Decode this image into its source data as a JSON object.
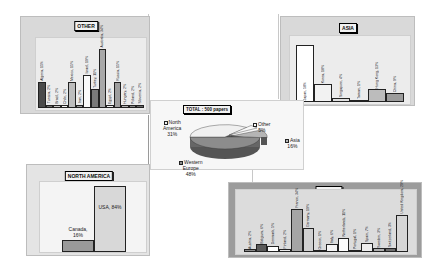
{
  "chart_data": [
    {
      "type": "pie",
      "title": "TOTAL : 500 papers",
      "categories": [
        "Western Europe",
        "North America",
        "Asia",
        "Other"
      ],
      "values": [
        48,
        31,
        16,
        5
      ],
      "labels": [
        "Western Europe 48%",
        "North America 31%",
        "Asia 16%",
        "Other 5%"
      ],
      "legend_position": "inline labels"
    },
    {
      "type": "bar",
      "title": "OTHER",
      "categories": [
        "Algeria",
        "Tunisia",
        "Brazil",
        "Chile",
        "Mexico",
        "Iran",
        "Israel",
        "Turkey",
        "Australia",
        "Egypt",
        "Russia",
        "Hungary",
        "Poland",
        "Slovenia"
      ],
      "values": [
        15,
        2,
        2,
        2,
        15,
        2,
        19,
        11,
        34,
        2,
        15,
        2,
        2,
        2
      ],
      "labels": [
        "Algeria, 15%",
        "Tunisia, 2%",
        "Brazil, 2%",
        "Chile, 2%",
        "Mexico, 15%",
        "Iran, 2%",
        "Israel, 19%",
        "Turkey, 11%",
        "Australia, 34%",
        "Egypt, 2%",
        "Russia, 15%",
        "Hungary, 2%",
        "Poland, 2%",
        "Slovenia, 2%"
      ],
      "xlabel": "",
      "ylabel": "",
      "grid": false
    },
    {
      "type": "bar",
      "title": "ASIA",
      "categories": [
        "Japan",
        "Korea",
        "Singapore",
        "Taiwan",
        "Hong Kong",
        "China"
      ],
      "values": [
        58,
        18,
        4,
        1,
        13,
        9
      ],
      "labels": [
        "Japan, 58%",
        "Korea, 18%",
        "Singapore, 4%",
        "Taiwan, 1%",
        "Hong Kong, 13%",
        "China, 9%"
      ],
      "xlabel": "",
      "ylabel": "",
      "grid": false
    },
    {
      "type": "bar",
      "title": "NORTH AMERICA",
      "categories": [
        "Canada",
        "USA"
      ],
      "values": [
        16,
        84
      ],
      "labels": [
        "Canada, 16%",
        "USA, 84%"
      ],
      "xlabel": "",
      "ylabel": "",
      "grid": false
    },
    {
      "type": "bar",
      "title": "EUROPE",
      "categories": [
        "Austria",
        "Belgium",
        "Denmark",
        "Finland",
        "France",
        "Germany",
        "Greece",
        "Italy",
        "Netherlands",
        "Portugal",
        "Spain",
        "Sweden",
        "Switzerland",
        "United Kingdom"
      ],
      "values": [
        2,
        6,
        5,
        2,
        34,
        19,
        1,
        6,
        11,
        1,
        7,
        3,
        3,
        29
      ],
      "labels": [
        "Austria, 2%",
        "Belgium, 6%",
        "Denmark, 5%",
        "Finland, 2%",
        "France, 34%",
        "Germany, 19%",
        "Greece, 1%",
        "Italy, 6%",
        "Netherlands, 11%",
        "Portugal, 1%",
        "Spain, 7%",
        "Sweden, 3%",
        "Switzerland, 3%",
        "United Kingdom, 29%"
      ],
      "xlabel": "",
      "ylabel": "",
      "grid": false
    }
  ],
  "pie": {
    "title": "TOTAL : 500 papers",
    "north_america_line1": "North",
    "north_america_line2": "America",
    "north_america_pct": "31%",
    "other_name": "Other",
    "other_pct": "5%",
    "asia_name": "Asia",
    "asia_pct": "16%",
    "europe_line1": "Western",
    "europe_line2": "Europe",
    "europe_pct": "48%"
  },
  "other": {
    "title": "OTHER",
    "bars": [
      {
        "label": "Algeria, 15%",
        "color": "#4a4a4a"
      },
      {
        "label": "Tunisia, 2%",
        "color": "#6e6e6e"
      },
      {
        "label": "Brazil, 2%",
        "color": "#c8c8c8"
      },
      {
        "label": "Chile, 2%",
        "color": "#f4f4f4"
      },
      {
        "label": "Mexico, 15%",
        "color": "#bdbdbd"
      },
      {
        "label": "Iran, 2%",
        "color": "#9a9a9a"
      },
      {
        "label": "Israel, 19%",
        "color": "#fafafa"
      },
      {
        "label": "Turkey, 11%",
        "color": "#7a7a7a"
      },
      {
        "label": "Australia, 34%",
        "color": "#a8a8a8"
      },
      {
        "label": "Egypt, 2%",
        "color": "#f0f0f0"
      },
      {
        "label": "Russia, 15%",
        "color": "#9e9e9e"
      },
      {
        "label": "Hungary, 2%",
        "color": "#b5b5b5"
      },
      {
        "label": "Poland, 2%",
        "color": "#8a8a8a"
      },
      {
        "label": "Slovenia, 2%",
        "color": "#6a6a6a"
      }
    ]
  },
  "asia": {
    "title": "ASIA",
    "bars": [
      {
        "label": "Japan, 58%",
        "color": "#ffffff"
      },
      {
        "label": "Korea, 18%",
        "color": "#f2f2f2"
      },
      {
        "label": "Singapore, 4%",
        "color": "#e0e0e0"
      },
      {
        "label": "Taiwan, 1%",
        "color": "#555555"
      },
      {
        "label": "Hong Kong, 13%",
        "color": "#bcbcbc"
      },
      {
        "label": "China, 9%",
        "color": "#9c9c9c"
      }
    ]
  },
  "north_america": {
    "title": "NORTH AMERICA",
    "canada_name": "Canada,",
    "canada_pct": "16%",
    "usa_label": "USA, 84%"
  },
  "europe": {
    "title": "EUROPE",
    "bars": [
      {
        "label": "Austria, 2%",
        "color": "#8c8c8c"
      },
      {
        "label": "Belgium, 6%",
        "color": "#5a5a5a"
      },
      {
        "label": "Denmark, 5%",
        "color": "#ffffff"
      },
      {
        "label": "Finland, 2%",
        "color": "#e8e8e8"
      },
      {
        "label": "France, 34%",
        "color": "#a5a5a5"
      },
      {
        "label": "Germany, 19%",
        "color": "#d0d0d0"
      },
      {
        "label": "Greece, 1%",
        "color": "#6a6a6a"
      },
      {
        "label": "Italy, 6%",
        "color": "#f5f5f5"
      },
      {
        "label": "Netherlands, 11%",
        "color": "#fcfcfc"
      },
      {
        "label": "Portugal, 1%",
        "color": "#777777"
      },
      {
        "label": "Spain, 7%",
        "color": "#ededed"
      },
      {
        "label": "Sweden, 3%",
        "color": "#b0b0b0"
      },
      {
        "label": "Switzerland, 3%",
        "color": "#6e6e6e"
      },
      {
        "label": "United Kingdom, 29%",
        "color": "#d6d6d6"
      }
    ]
  }
}
